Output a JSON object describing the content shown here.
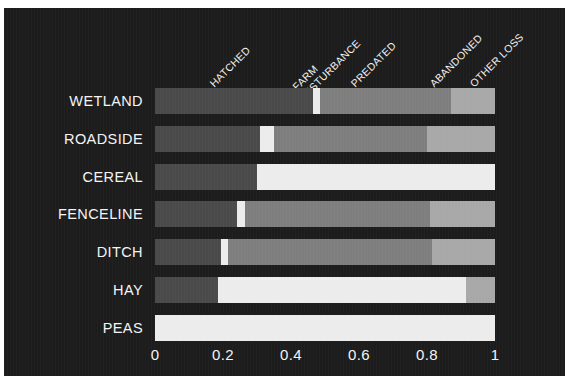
{
  "chart_data": {
    "type": "bar",
    "orientation": "horizontal",
    "stacked": true,
    "normalized": true,
    "title": "",
    "subtitle": "",
    "xlabel": "",
    "ylabel": "",
    "xlim": [
      0,
      1
    ],
    "xticks": [
      "0",
      "0.2",
      "0.4",
      "0.6",
      "0.8",
      "1"
    ],
    "xtick_values": [
      0,
      0.2,
      0.4,
      0.6,
      0.8,
      1
    ],
    "grid": false,
    "legend_position": "top-rotated",
    "background_color": "#1c1c1c",
    "text_color": "#f4f4f4",
    "categories": [
      "WETLAND",
      "ROADSIDE",
      "CEREAL",
      "FENCELINE",
      "DITCH",
      "HAY",
      "PEAS"
    ],
    "series": [
      {
        "name": "HATCHED",
        "color": "#4a4a4a",
        "values": [
          0.465,
          0.31,
          0.3,
          0.24,
          0.195,
          0.185,
          0
        ]
      },
      {
        "name": "FARM DISTURBANCE",
        "color": "#ececec",
        "values": [
          0.02,
          0.04,
          0.7,
          0.025,
          0.02,
          0.73,
          1
        ]
      },
      {
        "name": "PREDATED",
        "color": "#7e7e7e",
        "values": [
          0.385,
          0.45,
          0,
          0.545,
          0.6,
          0,
          0
        ]
      },
      {
        "name": "ABANDONED",
        "color": "#a8a8a8",
        "values": [
          0.13,
          0.2,
          0,
          0.19,
          0.185,
          0.085,
          0
        ]
      },
      {
        "name": "OTHER LOSS",
        "color": "#c8c8c8",
        "values": [
          0,
          0,
          0,
          0,
          0,
          0,
          0
        ]
      }
    ]
  },
  "legend": {
    "entries": [
      {
        "label": "HATCHED",
        "x": 212,
        "y": 70
      },
      {
        "label": "FARM\nDISTURBANCE",
        "x": 303,
        "y": 70
      },
      {
        "label": "PREDATED",
        "x": 353,
        "y": 70
      },
      {
        "label": "ABANDONED",
        "x": 432,
        "y": 70
      },
      {
        "label": "OTHER LOSS",
        "x": 472,
        "y": 70
      }
    ]
  },
  "axis": {
    "x_ticks": [
      {
        "label": "0",
        "pos": 151
      },
      {
        "label": "0.2",
        "pos": 219
      },
      {
        "label": "0.4",
        "pos": 287
      },
      {
        "label": "0.6",
        "pos": 355
      },
      {
        "label": "0.8",
        "pos": 423
      },
      {
        "label": "1",
        "pos": 491
      }
    ]
  }
}
